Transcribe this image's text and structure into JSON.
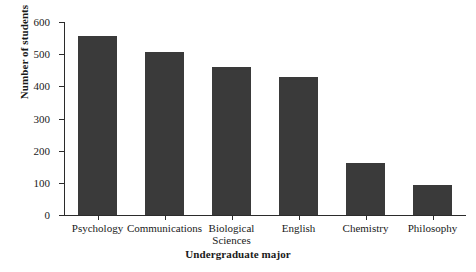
{
  "chart_data": {
    "type": "bar",
    "title": "",
    "xlabel": "Undergraduate major",
    "ylabel": "Number of students",
    "categories": [
      "Psychology",
      "Communications",
      "Biological\nSciences",
      "English",
      "Chemistry",
      "Philosophy"
    ],
    "values": [
      557,
      508,
      460,
      430,
      161,
      93
    ],
    "ylim": [
      0,
      600
    ],
    "yticks": [
      0,
      100,
      200,
      300,
      400,
      500,
      600
    ],
    "ytick_labels": [
      "0",
      "100",
      "200",
      "300",
      "400",
      "500",
      "600"
    ],
    "grid": false,
    "legend": null,
    "bar_color": "#3a3a3a",
    "axis_color": "#2b2b2b",
    "background": "#ffffff"
  }
}
